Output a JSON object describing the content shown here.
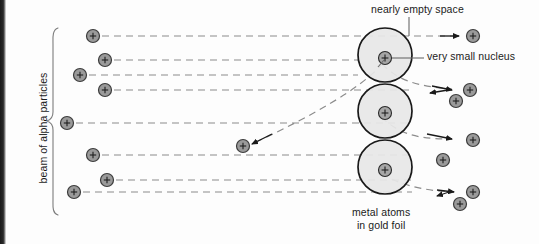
{
  "figure": {
    "type": "scientific-diagram"
  },
  "labels": {
    "nearly_empty_space": "nearly empty space",
    "very_small_nucleus": "very small nucleus",
    "metal_atoms_line1": "metal atoms",
    "metal_atoms_line2": "in gold foil",
    "beam_of_alpha_particles": "beam of alpha particles"
  },
  "colors": {
    "background": "#fdfdfd",
    "atom_fill": "#e7e7e7",
    "atom_stroke": "#1a1a1a",
    "particle_fill": "#9a9a9a",
    "particle_stroke": "#3c3c3c",
    "nucleus_fill": "#a6a6a6",
    "nucleus_stroke": "#2a2a2a",
    "ray_stroke": "#8c8c8c",
    "text": "#1b1b1b",
    "leader_stroke": "#6a6a6a",
    "scan_edge": "#1a1a1a"
  },
  "geometry": {
    "width": 539,
    "height": 244,
    "atom_radius": 27,
    "nucleus_radius": 6.5,
    "particle_radius": 6.5
  },
  "atoms": [
    {
      "name": "atom-top",
      "cx": 385,
      "cy": 55,
      "r": 27,
      "nucleus_cx": 385,
      "nucleus_cy": 58
    },
    {
      "name": "atom-middle",
      "cx": 385,
      "cy": 111,
      "r": 27,
      "nucleus_cx": 385,
      "nucleus_cy": 113
    },
    {
      "name": "atom-bottom",
      "cx": 385,
      "cy": 167,
      "r": 27,
      "nucleus_cx": 385,
      "nucleus_cy": 170
    }
  ],
  "incoming_particles": [
    {
      "name": "alpha-in-1",
      "cx": 93,
      "cy": 36
    },
    {
      "name": "alpha-in-2",
      "cx": 105,
      "cy": 60
    },
    {
      "name": "alpha-in-3",
      "cx": 80,
      "cy": 75
    },
    {
      "name": "alpha-in-4",
      "cx": 105,
      "cy": 90
    },
    {
      "name": "alpha-in-5",
      "cx": 67,
      "cy": 123
    },
    {
      "name": "alpha-in-6",
      "cx": 93,
      "cy": 155
    },
    {
      "name": "alpha-in-7",
      "cx": 107,
      "cy": 180
    },
    {
      "name": "alpha-in-8",
      "cx": 74,
      "cy": 192
    }
  ],
  "outgoing_particles": [
    {
      "name": "alpha-out-undeflected-top",
      "cx": 473,
      "cy": 36
    },
    {
      "name": "alpha-out-deflected-upper-a",
      "cx": 470,
      "cy": 90
    },
    {
      "name": "alpha-out-deflected-upper-b",
      "cx": 456,
      "cy": 101
    },
    {
      "name": "alpha-out-deflected-mid-a",
      "cx": 473,
      "cy": 140
    },
    {
      "name": "alpha-out-deflected-mid-b",
      "cx": 443,
      "cy": 160
    },
    {
      "name": "alpha-out-deflected-lower-a",
      "cx": 473,
      "cy": 192
    },
    {
      "name": "alpha-out-deflected-lower-b",
      "cx": 460,
      "cy": 204
    },
    {
      "name": "alpha-backscattered",
      "cx": 243,
      "cy": 146
    }
  ],
  "beam_rays": [
    {
      "name": "ray-1",
      "y": 36,
      "x1": 102,
      "x2": 455
    },
    {
      "name": "ray-2",
      "y": 60,
      "x1": 114,
      "x2": 358
    },
    {
      "name": "ray-3",
      "y": 75,
      "x1": 89,
      "x2": 358
    },
    {
      "name": "ray-4",
      "y": 90,
      "x1": 114,
      "x2": 412
    },
    {
      "name": "ray-5",
      "y": 123,
      "x1": 76,
      "x2": 412
    },
    {
      "name": "ray-6",
      "y": 155,
      "x1": 102,
      "x2": 412
    },
    {
      "name": "ray-7",
      "y": 180,
      "x1": 116,
      "x2": 412
    },
    {
      "name": "ray-8",
      "y": 192,
      "x1": 83,
      "x2": 412
    }
  ],
  "scatter_paths": [
    {
      "name": "scatter-top-to-upper-right",
      "d": "M 382 64 C 398 80 415 86 452 89"
    },
    {
      "name": "scatter-top-steep-down",
      "d": "M 383 63 C 362 88 310 117 254 143"
    },
    {
      "name": "scatter-mid-to-right",
      "d": "M 381 117 C 398 132 412 139 450 139"
    },
    {
      "name": "scatter-bottom-to-right",
      "d": "M 381 174 C 400 184 418 190 452 192"
    }
  ],
  "leader_lines": [
    {
      "name": "leader-nearly-empty-space",
      "d": "M 409 17 L 409 36"
    },
    {
      "name": "leader-very-small-nucleus",
      "d": "M 392 58 L 424 58"
    },
    {
      "name": "leader-nucleus-tick",
      "d": "M 378 67 L 384 60"
    }
  ],
  "brace": {
    "name": "beam-brace",
    "d": "M 58 28 C 52 30 53 38 53 44 L 53 112 C 53 118 50 120 47 121 C 50 122 53 124 53 130 L 53 200 C 53 206 52 213 58 215"
  }
}
